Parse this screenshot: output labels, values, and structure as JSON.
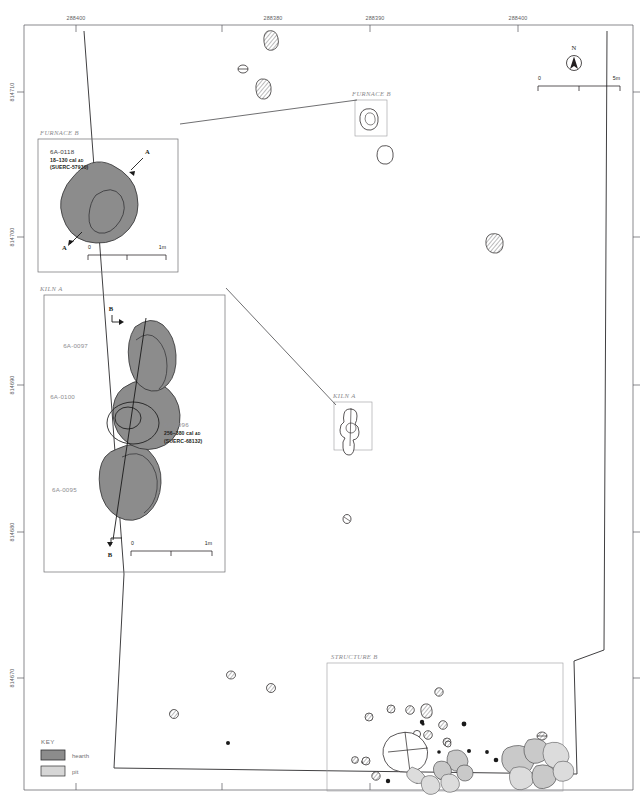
{
  "figure": {
    "type": "archaeological-site-plan"
  },
  "axes": {
    "top_labels": [
      "288400",
      "288380",
      "288390",
      "288400"
    ],
    "top_label_x": [
      76,
      273,
      375,
      518
    ],
    "left_labels": [
      "814710",
      "814700",
      "814690",
      "814680",
      "814670"
    ],
    "left_label_y": [
      90,
      232,
      388,
      520,
      676
    ]
  },
  "north_arrow": {
    "label": "N"
  },
  "main_scalebar": {
    "start": "0",
    "end": "5m"
  },
  "key": {
    "title": "KEY",
    "items": [
      {
        "label": "hearth",
        "color": "#8c8c8c"
      },
      {
        "label": "pit",
        "color": "#d6d6d6"
      }
    ]
  },
  "insets": [
    {
      "id": "furnace-b-detail",
      "title": "FURNACE B",
      "features": [
        {
          "id": "6A-0118",
          "date": "18–130 cal",
          "date_era": "AD",
          "lab_code": "(SUERC-57930)"
        }
      ],
      "section_marks": [
        "A",
        "A"
      ],
      "scalebar": {
        "start": "0",
        "end": "1m"
      }
    },
    {
      "id": "kiln-a-detail",
      "title": "KILN A",
      "features": [
        {
          "id": "6A-0097"
        },
        {
          "id": "6A-0100"
        },
        {
          "id": "6A-0095"
        },
        {
          "id": "6A-0096",
          "date": "256–380 cal",
          "date_era": "AD",
          "lab_code": "(SUERC-68132)"
        }
      ],
      "section_marks": [
        "B",
        "B"
      ],
      "scalebar": {
        "start": "0",
        "end": "1m"
      }
    }
  ],
  "map_callouts": [
    {
      "id": "furnace-b-locator",
      "title": "FURNACE B"
    },
    {
      "id": "kiln-a-locator",
      "title": "KILN A"
    },
    {
      "id": "structure-b-area",
      "title": "STRUCTURE B"
    }
  ]
}
